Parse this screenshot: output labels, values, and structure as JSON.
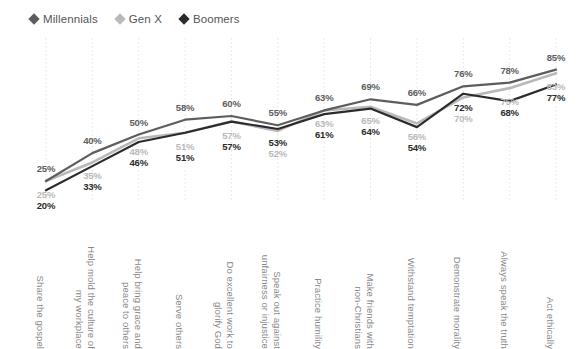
{
  "legend": {
    "items": [
      {
        "label": "Millennials",
        "color": "#5d5d5d",
        "marker": "diamond-marker"
      },
      {
        "label": "Gen X",
        "color": "#b9b9b9",
        "marker": "diamond-marker"
      },
      {
        "label": "Boomers",
        "color": "#2b2b2b",
        "marker": "diamond-marker"
      }
    ]
  },
  "chart_data": {
    "type": "line",
    "title": "",
    "xlabel": "",
    "ylabel": "",
    "ylim": [
      0,
      100
    ],
    "grid": "vertical-dotted",
    "legend_position": "top-left",
    "value_suffix": "%",
    "categories": [
      "Share the gospel",
      "Help mold the culture of my workplace",
      "Help bring grace and peace to others",
      "Serve others",
      "Do excellent work to glorify God",
      "Speak out against unfairness or injustice",
      "Practice humility",
      "Make friends with non-Christians",
      "Withstand temptation",
      "Demonstrate morality",
      "Always speak the truth",
      "Act ethically"
    ],
    "category_lines": [
      [
        "Share the gospel"
      ],
      [
        "Help mold the culture of",
        "my workplace"
      ],
      [
        "Help bring grace and",
        "peace to others"
      ],
      [
        "Serve others"
      ],
      [
        "Do excellent work to",
        "glorify God"
      ],
      [
        "Speak out against",
        "unfairness or injustice"
      ],
      [
        "Practice humility"
      ],
      [
        "Make friends with",
        "non-Christians"
      ],
      [
        "Withstand temptation"
      ],
      [
        "Demonstrate morality"
      ],
      [
        "Always speak the truth"
      ],
      [
        "Act ethically"
      ]
    ],
    "series": [
      {
        "name": "Millennials",
        "color": "#5d5d5d",
        "values": [
          25,
          40,
          50,
          58,
          60,
          55,
          63,
          69,
          66,
          76,
          78,
          85
        ],
        "labels": [
          "25%",
          "40%",
          "50%",
          "58%",
          "60%",
          "55%",
          "63%",
          "69%",
          "66%",
          "76%",
          "78%",
          "85%"
        ]
      },
      {
        "name": "Gen X",
        "color": "#b9b9b9",
        "values": [
          25,
          35,
          48,
          51,
          57,
          52,
          63,
          65,
          56,
          70,
          75,
          83
        ],
        "labels": [
          "25%",
          "35%",
          "48%",
          "51%",
          "57%",
          "52%",
          "63%",
          "65%",
          "56%",
          "70%",
          "75%",
          "83%"
        ]
      },
      {
        "name": "Boomers",
        "color": "#2b2b2b",
        "values": [
          20,
          33,
          46,
          51,
          57,
          53,
          61,
          64,
          54,
          72,
          68,
          77
        ],
        "labels": [
          "20%",
          "33%",
          "46%",
          "51%",
          "57%",
          "53%",
          "61%",
          "64%",
          "54%",
          "72%",
          "68%",
          "77%"
        ]
      }
    ]
  }
}
